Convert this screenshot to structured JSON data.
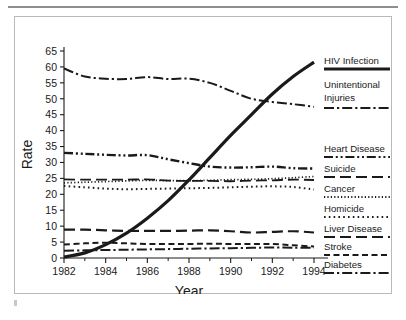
{
  "figure": {
    "frame_color": "#b9b9b9",
    "rule_color": "#8e8e8e",
    "background": "#ffffff",
    "ink_color": "#1a1a1a"
  },
  "chart_data": {
    "type": "line",
    "title": "",
    "xlabel": "Year",
    "ylabel": "Rate",
    "xlim": [
      1982,
      1994
    ],
    "ylim": [
      0,
      65
    ],
    "xticks": [
      1982,
      1984,
      1986,
      1988,
      1990,
      1992,
      1994
    ],
    "yticks": [
      0,
      5,
      10,
      15,
      20,
      25,
      30,
      35,
      40,
      45,
      50,
      55,
      60,
      65
    ],
    "grid": false,
    "legend_position": "right",
    "x": [
      1982,
      1983,
      1984,
      1985,
      1986,
      1987,
      1988,
      1989,
      1990,
      1991,
      1992,
      1993,
      1994
    ],
    "series": [
      {
        "name": "HIV Infection",
        "style": "solid",
        "width": 3.2,
        "values": [
          0.3,
          1.6,
          4.2,
          7.8,
          12.5,
          18.0,
          24.5,
          31.5,
          38.5,
          45.0,
          51.5,
          57.0,
          61.5
        ]
      },
      {
        "name": "Unintentional Injuries",
        "style": "dashdot",
        "width": 2.0,
        "values": [
          59.5,
          57.0,
          56.3,
          56.2,
          56.8,
          56.2,
          56.3,
          55.0,
          52.5,
          50.0,
          49.0,
          48.3,
          47.5
        ]
      },
      {
        "name": "Heart Disease",
        "style": "dashdotdot",
        "width": 2.4,
        "values": [
          33.0,
          32.7,
          32.4,
          32.2,
          32.3,
          31.0,
          29.8,
          28.7,
          28.4,
          28.5,
          28.7,
          28.2,
          28.1
        ]
      },
      {
        "name": "Suicide",
        "style": "longdash",
        "width": 1.8,
        "values": [
          24.7,
          24.6,
          24.6,
          24.6,
          24.7,
          24.3,
          24.2,
          24.2,
          24.1,
          24.3,
          24.4,
          24.6,
          24.5
        ]
      },
      {
        "name": "Cancer",
        "style": "finedot",
        "width": 1.7,
        "values": [
          23.6,
          23.8,
          24.0,
          24.2,
          24.4,
          24.3,
          24.3,
          24.4,
          24.6,
          24.7,
          24.9,
          25.2,
          25.6
        ]
      },
      {
        "name": "Homicide",
        "style": "dot",
        "width": 2.0,
        "values": [
          22.6,
          22.2,
          21.8,
          21.6,
          21.7,
          21.8,
          21.9,
          22.0,
          22.2,
          22.4,
          22.5,
          22.3,
          21.5
        ]
      },
      {
        "name": "Liver Disease",
        "style": "longdash",
        "width": 2.2,
        "values": [
          8.9,
          8.9,
          8.7,
          8.5,
          8.5,
          8.5,
          8.6,
          8.7,
          8.4,
          8.0,
          8.2,
          8.4,
          8.0
        ]
      },
      {
        "name": "Stroke",
        "style": "dash",
        "width": 2.0,
        "values": [
          4.2,
          4.6,
          4.8,
          4.6,
          4.4,
          4.4,
          4.4,
          4.5,
          4.4,
          4.4,
          4.4,
          4.0,
          3.6
        ]
      },
      {
        "name": "Diabetes",
        "style": "dashdot",
        "width": 2.0,
        "values": [
          2.3,
          2.4,
          2.5,
          2.6,
          2.7,
          2.8,
          2.9,
          3.0,
          3.1,
          3.2,
          3.3,
          3.2,
          3.2
        ]
      }
    ]
  },
  "legend": {
    "entries": [
      {
        "label": "HIV Infection"
      },
      {
        "label": "Unintentional"
      },
      {
        "label": "Injuries"
      },
      {
        "label": "Heart Disease"
      },
      {
        "label": "Suicide"
      },
      {
        "label": "Cancer"
      },
      {
        "label": "Homicide"
      },
      {
        "label": "Liver Disease"
      },
      {
        "label": "Stroke"
      },
      {
        "label": "Diabetes"
      }
    ]
  }
}
